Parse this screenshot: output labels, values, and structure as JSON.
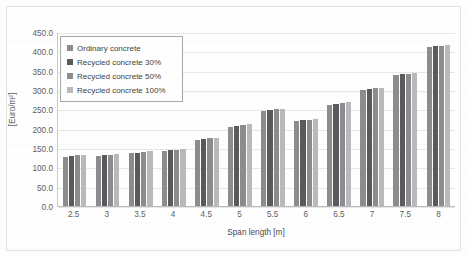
{
  "chart_data": {
    "type": "bar",
    "title": "",
    "xlabel": "Span length [m]",
    "ylabel": "[Euro/m²]",
    "categories": [
      "2.5",
      "3",
      "3.5",
      "4",
      "4.5",
      "5",
      "5.5",
      "6",
      "6.5",
      "7",
      "7.5",
      "8"
    ],
    "ylim": [
      0,
      450
    ],
    "yticks": [
      "0.0",
      "50.0",
      "100.0",
      "150.0",
      "200.0",
      "250.0",
      "300.0",
      "350.0",
      "400.0",
      "450.0"
    ],
    "ytick_values": [
      0,
      50,
      100,
      150,
      200,
      250,
      300,
      350,
      400,
      450
    ],
    "grid": true,
    "legend_position": "upper-left-inside",
    "series": [
      {
        "name": "Ordinary concrete",
        "color": "#8c8c8e",
        "values": [
          128,
          130,
          136,
          142,
          172,
          205,
          246,
          220,
          262,
          300,
          338,
          410
        ]
      },
      {
        "name": "Recycled concrete 30%",
        "color": "#5a5a5c",
        "values": [
          130,
          132,
          138,
          144,
          174,
          208,
          249,
          222,
          265,
          303,
          341,
          413
        ]
      },
      {
        "name": "Recycled concrete 50%",
        "color": "#8c8c8e",
        "values": [
          131,
          133,
          139,
          145,
          175,
          209,
          250,
          223,
          266,
          304,
          342,
          414
        ]
      },
      {
        "name": "Recycled concrete 100%",
        "color": "#b9b9bb",
        "values": [
          133,
          135,
          141,
          147,
          177,
          211,
          252,
          225,
          268,
          306,
          344,
          416
        ]
      }
    ]
  }
}
